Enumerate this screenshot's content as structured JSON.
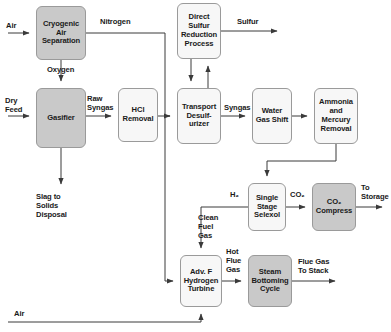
{
  "diagram": {
    "type": "process-flow-diagram",
    "colors": {
      "shaded_fill": "#c9c9c9",
      "light_fill": "#f7f7f7",
      "stroke": "#9a9a9a",
      "line": "#3a3a3a",
      "text": "#1a1a1a"
    },
    "nodes": [
      {
        "id": "cryogenic_air_separation",
        "label": "Cryogenic\nAir\nSeparation",
        "style": "shaded",
        "x": 36,
        "y": 6,
        "w": 50,
        "h": 54
      },
      {
        "id": "gasifier",
        "label": "Gasifier",
        "style": "shaded",
        "x": 36,
        "y": 88,
        "w": 50,
        "h": 60
      },
      {
        "id": "hcl_removal",
        "label": "HCl\nRemoval",
        "style": "light",
        "x": 118,
        "y": 88,
        "w": 40,
        "h": 54
      },
      {
        "id": "direct_sulfur_reduction_process",
        "label": "Direct\nSulfur\nReduction\nProcess",
        "style": "light",
        "x": 177,
        "y": 3,
        "w": 44,
        "h": 56
      },
      {
        "id": "transport_desulfurizer",
        "label": "Transport\nDesulf-\nurizer",
        "style": "light",
        "x": 177,
        "y": 88,
        "w": 44,
        "h": 56
      },
      {
        "id": "water_gas_shift",
        "label": "Water\nGas\nShift",
        "style": "light",
        "x": 252,
        "y": 88,
        "w": 40,
        "h": 56
      },
      {
        "id": "ammonia_and_mercury_removal",
        "label": "Ammonia\nand\nMercury\nRemoval",
        "style": "light",
        "x": 314,
        "y": 88,
        "w": 44,
        "h": 56
      },
      {
        "id": "single_stage_selexol",
        "label": "Single\nStage\nSelexol",
        "style": "light",
        "x": 248,
        "y": 183,
        "w": 38,
        "h": 48
      },
      {
        "id": "co2_compress",
        "label": "CO₂\nCompress",
        "style": "shaded",
        "x": 312,
        "y": 183,
        "w": 44,
        "h": 48
      },
      {
        "id": "adv_f_hydrogen_turbine",
        "label": "Adv. F\nHydrogen\nTurbine",
        "style": "light",
        "x": 180,
        "y": 255,
        "w": 42,
        "h": 52
      },
      {
        "id": "steam_bottoming_cycle",
        "label": "Steam\nBottoming\nCycle",
        "style": "shaded",
        "x": 248,
        "y": 255,
        "w": 44,
        "h": 52
      }
    ],
    "stream_labels": [
      {
        "id": "air_in",
        "text": "Air",
        "x": 6,
        "y": 22,
        "align": "left"
      },
      {
        "id": "nitrogen",
        "text": "Nitrogen",
        "x": 100,
        "y": 18,
        "align": "left"
      },
      {
        "id": "oxygen",
        "text": "Oxygen",
        "x": 47,
        "y": 66,
        "align": "left"
      },
      {
        "id": "dry_feed",
        "text": "Dry\nFeed",
        "x": 5,
        "y": 97,
        "align": "left"
      },
      {
        "id": "raw_syngas",
        "text": "Raw\nSyngas",
        "x": 87,
        "y": 95,
        "align": "left"
      },
      {
        "id": "sulfur",
        "text": "Sulfur",
        "x": 237,
        "y": 18,
        "align": "left"
      },
      {
        "id": "syngas",
        "text": "Syngas",
        "x": 224,
        "y": 104,
        "align": "left"
      },
      {
        "id": "h2",
        "text": "H₂",
        "x": 230,
        "y": 191,
        "align": "left"
      },
      {
        "id": "co2",
        "text": "CO₂",
        "x": 290,
        "y": 191,
        "align": "left"
      },
      {
        "id": "to_storage",
        "text": "To\nStorage",
        "x": 361,
        "y": 184,
        "align": "left"
      },
      {
        "id": "clean_fuel_gas",
        "text": "Clean\nFuel\nGas",
        "x": 198,
        "y": 214,
        "align": "left"
      },
      {
        "id": "hot_flue_gas",
        "text": "Hot\nFlue\nGas",
        "x": 226,
        "y": 248,
        "align": "left"
      },
      {
        "id": "flue_gas_to_stack",
        "text": "Flue Gas\nTo Stack",
        "x": 298,
        "y": 258,
        "align": "left"
      },
      {
        "id": "slag_to_solids_disposal",
        "text": "Slag to\nSolids\nDisposal",
        "x": 36,
        "y": 193,
        "align": "left"
      },
      {
        "id": "air_bottom",
        "text": "Air",
        "x": 14,
        "y": 310,
        "align": "left"
      }
    ],
    "connections": [
      {
        "id": "air-to-cryogenic",
        "from": "air-inlet",
        "to": "cryogenic_air_separation"
      },
      {
        "id": "cryogenic-nitrogen-to-desulfurizer",
        "from": "cryogenic_air_separation",
        "to": "transport_desulfurizer",
        "label": "Nitrogen"
      },
      {
        "id": "cryogenic-oxygen-to-gasifier",
        "from": "cryogenic_air_separation",
        "to": "gasifier",
        "label": "Oxygen"
      },
      {
        "id": "dryfeed-to-gasifier",
        "from": "dry-feed-inlet",
        "to": "gasifier",
        "label": "Dry Feed"
      },
      {
        "id": "gasifier-to-hcl",
        "from": "gasifier",
        "to": "hcl_removal",
        "label": "Raw Syngas"
      },
      {
        "id": "gasifier-to-slag",
        "from": "gasifier",
        "to": "slag-disposal",
        "label": "Slag to Solids Disposal"
      },
      {
        "id": "hcl-to-desulfurizer",
        "from": "hcl_removal",
        "to": "transport_desulfurizer"
      },
      {
        "id": "dsrp-to-desulfurizer",
        "from": "direct_sulfur_reduction_process",
        "to": "transport_desulfurizer"
      },
      {
        "id": "desulfurizer-to-dsrp",
        "from": "transport_desulfurizer",
        "to": "direct_sulfur_reduction_process"
      },
      {
        "id": "dsrp-to-sulfur",
        "from": "direct_sulfur_reduction_process",
        "to": "sulfur-outlet",
        "label": "Sulfur"
      },
      {
        "id": "desulfurizer-to-wgs",
        "from": "transport_desulfurizer",
        "to": "water_gas_shift",
        "label": "Syngas"
      },
      {
        "id": "wgs-to-ammonia",
        "from": "water_gas_shift",
        "to": "ammonia_and_mercury_removal"
      },
      {
        "id": "ammonia-to-selexol",
        "from": "ammonia_and_mercury_removal",
        "to": "single_stage_selexol"
      },
      {
        "id": "selexol-to-co2compress",
        "from": "single_stage_selexol",
        "to": "co2_compress",
        "label": "CO₂"
      },
      {
        "id": "co2compress-to-storage",
        "from": "co2_compress",
        "to": "storage-outlet",
        "label": "To Storage"
      },
      {
        "id": "selexol-h2-to-turbine",
        "from": "single_stage_selexol",
        "to": "adv_f_hydrogen_turbine",
        "label": "H₂ / Clean Fuel Gas"
      },
      {
        "id": "nitrogen-to-turbine",
        "from": "cryogenic_air_separation",
        "to": "adv_f_hydrogen_turbine"
      },
      {
        "id": "air-to-turbine",
        "from": "air-bottom-inlet",
        "to": "adv_f_hydrogen_turbine",
        "label": "Air"
      },
      {
        "id": "turbine-to-steam",
        "from": "adv_f_hydrogen_turbine",
        "to": "steam_bottoming_cycle",
        "label": "Hot Flue Gas"
      },
      {
        "id": "steam-to-stack",
        "from": "steam_bottoming_cycle",
        "to": "stack-outlet",
        "label": "Flue Gas To Stack"
      }
    ]
  }
}
